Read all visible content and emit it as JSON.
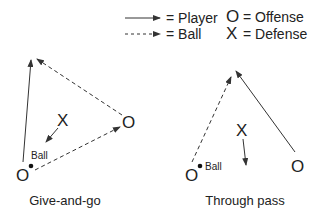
{
  "legend": {
    "player_label": "= Player",
    "ball_label": "= Ball",
    "offense_symbol": "O",
    "offense_label": "= Offense",
    "defense_symbol": "X",
    "defense_label": "= Defense"
  },
  "diagrams": [
    {
      "caption": "Give-and-go",
      "offense_1": "O",
      "offense_2": "O",
      "defense": "X",
      "ball_label": "Ball"
    },
    {
      "caption": "Through pass",
      "offense_1": "O",
      "offense_2": "O",
      "defense": "X",
      "ball_label": "Ball"
    }
  ],
  "colors": {
    "line": "#333333",
    "text": "#222222",
    "background": "#ffffff"
  }
}
